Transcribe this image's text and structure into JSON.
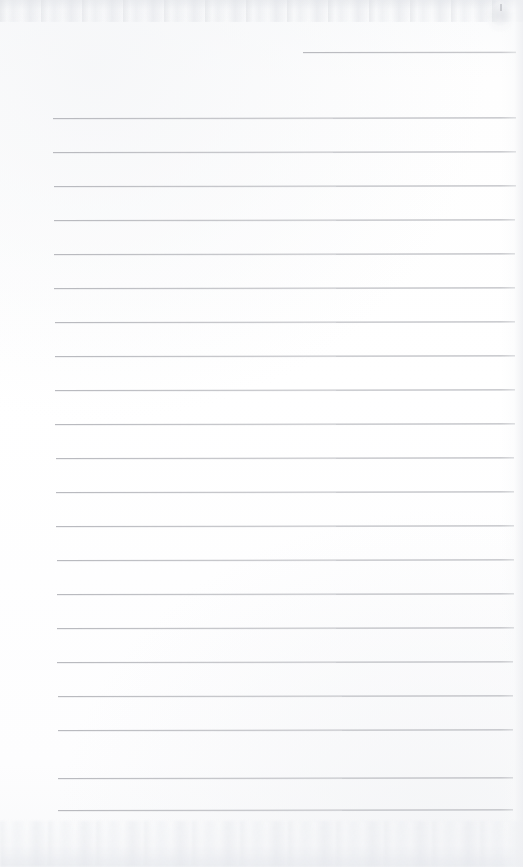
{
  "document": {
    "kind": "scanned-blank-ruled-paper",
    "title": "Blank ruled notebook page",
    "orientation": "portrait",
    "width_px": 523,
    "height_px": 867,
    "has_text": false,
    "has_handwriting": false,
    "visible_text": ""
  },
  "paper": {
    "background_color": "#fdfdfe",
    "tone": "near-white",
    "edge_noise_top": true,
    "edge_noise_bottom": true,
    "right_edge_shadow": true,
    "corner_blot_top_right": true
  },
  "ruling": {
    "line_color": "#b9babf",
    "line_thickness_px": 1,
    "line_spacing_px": 34,
    "line_count": 22,
    "left_margin_px": 53,
    "right_end_px": 515,
    "first_line_is_partial": true,
    "first_line_start_px": 303,
    "lines": [
      {
        "index": 1,
        "y": 52,
        "x_start": 303,
        "x_end": 516,
        "partial": true
      },
      {
        "index": 2,
        "y": 118,
        "x_start": 53,
        "x_end": 516,
        "partial": false
      },
      {
        "index": 3,
        "y": 152,
        "x_start": 53,
        "x_end": 516,
        "partial": false
      },
      {
        "index": 4,
        "y": 186,
        "x_start": 54,
        "x_end": 516,
        "partial": false
      },
      {
        "index": 5,
        "y": 220,
        "x_start": 54,
        "x_end": 515,
        "partial": false
      },
      {
        "index": 6,
        "y": 254,
        "x_start": 54,
        "x_end": 515,
        "partial": false
      },
      {
        "index": 7,
        "y": 288,
        "x_start": 54,
        "x_end": 515,
        "partial": false
      },
      {
        "index": 8,
        "y": 322,
        "x_start": 55,
        "x_end": 515,
        "partial": false
      },
      {
        "index": 9,
        "y": 356,
        "x_start": 55,
        "x_end": 515,
        "partial": false
      },
      {
        "index": 10,
        "y": 390,
        "x_start": 55,
        "x_end": 515,
        "partial": false
      },
      {
        "index": 11,
        "y": 424,
        "x_start": 55,
        "x_end": 515,
        "partial": false
      },
      {
        "index": 12,
        "y": 458,
        "x_start": 56,
        "x_end": 514,
        "partial": false
      },
      {
        "index": 13,
        "y": 492,
        "x_start": 56,
        "x_end": 514,
        "partial": false
      },
      {
        "index": 14,
        "y": 526,
        "x_start": 56,
        "x_end": 514,
        "partial": false
      },
      {
        "index": 15,
        "y": 560,
        "x_start": 57,
        "x_end": 514,
        "partial": false
      },
      {
        "index": 16,
        "y": 594,
        "x_start": 57,
        "x_end": 514,
        "partial": false
      },
      {
        "index": 17,
        "y": 628,
        "x_start": 57,
        "x_end": 514,
        "partial": false
      },
      {
        "index": 18,
        "y": 662,
        "x_start": 57,
        "x_end": 513,
        "partial": false
      },
      {
        "index": 19,
        "y": 696,
        "x_start": 58,
        "x_end": 513,
        "partial": false
      },
      {
        "index": 20,
        "y": 730,
        "x_start": 58,
        "x_end": 513,
        "partial": false
      },
      {
        "index": 21,
        "y": 778,
        "x_start": 58,
        "x_end": 513,
        "partial": false
      },
      {
        "index": 22,
        "y": 810,
        "x_start": 58,
        "x_end": 513,
        "partial": false
      }
    ]
  }
}
